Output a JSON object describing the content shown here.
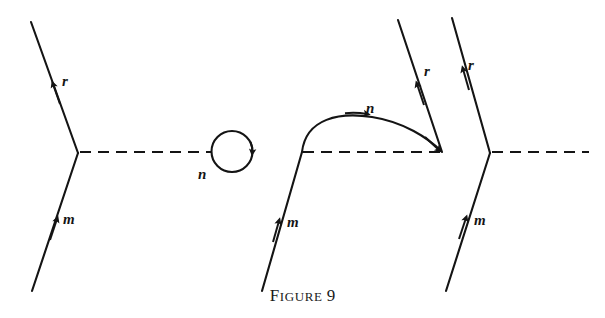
{
  "figure": {
    "caption_prefix_first": "F",
    "caption_prefix_rest": "IGURE",
    "caption_number": "9",
    "caption_full": "FIGURE 9",
    "background_color": "#ffffff",
    "ink_color": "#141414"
  },
  "diagrams": [
    {
      "id": "diagram-1",
      "name": "self-energy-loop-diagram",
      "labels": {
        "outgoing_fermion": "r",
        "incoming_fermion": "m",
        "loop_particle": "n"
      }
    },
    {
      "id": "diagram-2",
      "name": "vertex-correction-arc-diagram",
      "labels": {
        "outgoing_fermion": "r",
        "incoming_fermion": "m",
        "arc_particle": "n"
      }
    },
    {
      "id": "diagram-3",
      "name": "bare-vertex-diagram",
      "labels": {
        "outgoing_fermion": "r",
        "incoming_fermion": "m"
      }
    }
  ],
  "geometry": {
    "d1": {
      "vertex": [
        78,
        153
      ],
      "r_line": [
        [
          31,
          22
        ],
        [
          78,
          153
        ]
      ],
      "m_line": [
        [
          78,
          153
        ],
        [
          32,
          291
        ]
      ],
      "dashed_line": [
        [
          80,
          152
        ],
        [
          212,
          152
        ]
      ],
      "loop_circle": {
        "cx": 232,
        "cy": 151.5,
        "r": 20.5
      },
      "r_label": [
        62,
        84
      ],
      "m_label": [
        63,
        222
      ],
      "n_label": [
        203,
        177
      ]
    },
    "d2": {
      "vertex": [
        302,
        152
      ],
      "arc_end": [
        442,
        152
      ],
      "arc_peak_y": 116,
      "r_line": [
        [
          442,
          152
        ],
        [
          398,
          20
        ]
      ],
      "m_line": [
        [
          302,
          152
        ],
        [
          262,
          291
        ]
      ],
      "dashed_line": [
        [
          303,
          152
        ],
        [
          440,
          152
        ]
      ],
      "r_label": [
        424,
        73
      ],
      "m_label": [
        287,
        224
      ],
      "n_label": [
        372,
        110
      ]
    },
    "d3": {
      "vertex": [
        490,
        153
      ],
      "r_line": [
        [
          452,
          18
        ],
        [
          490,
          153
        ]
      ],
      "m_line": [
        [
          490,
          153
        ],
        [
          446,
          291
        ]
      ],
      "dashed_line": [
        [
          492,
          152
        ],
        [
          589,
          152
        ]
      ],
      "r_label": [
        470,
        68
      ],
      "m_label": [
        474,
        222
      ]
    }
  }
}
